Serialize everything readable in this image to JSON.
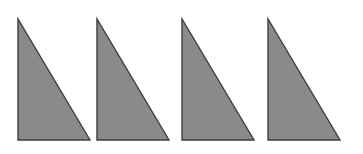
{
  "figure": {
    "name": "four-congruent-right-triangles",
    "background_color": "#ffffff",
    "canvas": {
      "width": 363,
      "height": 154
    },
    "shape_style": {
      "fill_color": "#8a8a8a",
      "stroke_color": "#3d3d3d",
      "stroke_width": 1.4
    },
    "shape_count": 4,
    "shapes": [
      {
        "id": "triangle-1",
        "label": "Triangle 1",
        "type": "right-triangle",
        "points": "18,19 18,140 90,140",
        "apex": {
          "x": 18,
          "y": 19
        },
        "right_angle": {
          "x": 18,
          "y": 140
        },
        "base_end": {
          "x": 90,
          "y": 140
        },
        "leg_vertical": 121,
        "leg_horizontal": 72
      },
      {
        "id": "triangle-2",
        "label": "Triangle 2",
        "type": "right-triangle",
        "points": "97,19 97,140 169,140",
        "apex": {
          "x": 97,
          "y": 19
        },
        "right_angle": {
          "x": 97,
          "y": 140
        },
        "base_end": {
          "x": 169,
          "y": 140
        },
        "leg_vertical": 121,
        "leg_horizontal": 72
      },
      {
        "id": "triangle-3",
        "label": "Triangle 3",
        "type": "right-triangle",
        "points": "182,19 182,140 254,140",
        "apex": {
          "x": 182,
          "y": 19
        },
        "right_angle": {
          "x": 182,
          "y": 140
        },
        "base_end": {
          "x": 254,
          "y": 140
        },
        "leg_vertical": 121,
        "leg_horizontal": 72
      },
      {
        "id": "triangle-4",
        "label": "Triangle 4",
        "type": "right-triangle",
        "points": "268,19 268,140 340,140",
        "apex": {
          "x": 268,
          "y": 19
        },
        "right_angle": {
          "x": 268,
          "y": 140
        },
        "base_end": {
          "x": 340,
          "y": 140
        },
        "leg_vertical": 121,
        "leg_horizontal": 72
      }
    ]
  }
}
